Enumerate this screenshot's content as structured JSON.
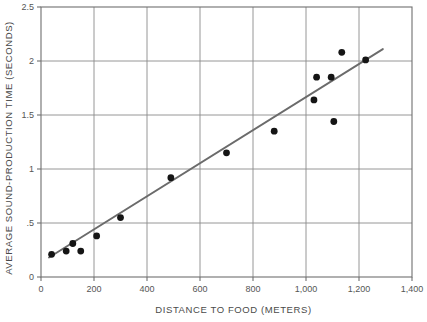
{
  "chart_data": {
    "type": "scatter",
    "title": "",
    "xlabel": "DISTANCE TO FOOD (METERS)",
    "ylabel": "AVERAGE SOUND-PRODUCTION TIME (SECONDS)",
    "xlim": [
      0,
      1400
    ],
    "ylim": [
      0,
      2.5
    ],
    "xticks": [
      0,
      200,
      400,
      600,
      800,
      1000,
      1200,
      1400
    ],
    "xtick_labels": [
      "0",
      "200",
      "400",
      "600",
      "800",
      "1,000",
      "1,200",
      "1,400"
    ],
    "yticks": [
      0,
      0.5,
      1,
      1.5,
      2,
      2.5
    ],
    "ytick_labels": [
      "0",
      ".5",
      "1",
      "1.5",
      "2",
      "2.5"
    ],
    "grid": true,
    "legend": null,
    "marker_color": "#151515",
    "line_color": "#6b6b6b",
    "points": [
      {
        "x": 40,
        "y": 0.21
      },
      {
        "x": 95,
        "y": 0.24
      },
      {
        "x": 120,
        "y": 0.31
      },
      {
        "x": 150,
        "y": 0.24
      },
      {
        "x": 210,
        "y": 0.38
      },
      {
        "x": 300,
        "y": 0.55
      },
      {
        "x": 490,
        "y": 0.92
      },
      {
        "x": 700,
        "y": 1.15
      },
      {
        "x": 880,
        "y": 1.35
      },
      {
        "x": 1030,
        "y": 1.64
      },
      {
        "x": 1040,
        "y": 1.85
      },
      {
        "x": 1095,
        "y": 1.85
      },
      {
        "x": 1105,
        "y": 1.44
      },
      {
        "x": 1135,
        "y": 2.08
      },
      {
        "x": 1225,
        "y": 2.01
      }
    ],
    "fit_line": {
      "name": "least-squares fit",
      "x1": 30,
      "y1": 0.18,
      "x2": 1290,
      "y2": 2.11
    }
  }
}
